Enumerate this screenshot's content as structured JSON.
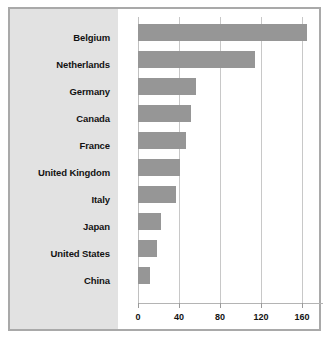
{
  "chart_data": {
    "type": "bar",
    "orientation": "horizontal",
    "title": "",
    "subtitle": "",
    "xlabel": "",
    "ylabel": "",
    "categories": [
      "Belgium",
      "Netherlands",
      "Germany",
      "Canada",
      "France",
      "United Kingdom",
      "Italy",
      "Japan",
      "United States",
      "China"
    ],
    "values": [
      165,
      114,
      57,
      52,
      47,
      41,
      37,
      22,
      19,
      12
    ],
    "series": [
      {
        "name": "",
        "values": [
          165,
          114,
          57,
          52,
          47,
          41,
          37,
          22,
          19,
          12
        ]
      }
    ],
    "xlim": [
      0,
      180
    ],
    "ylim": null,
    "xticks": [
      0,
      40,
      80,
      120,
      160
    ],
    "xtick_labels": [
      "0",
      "40",
      "80",
      "120",
      "160"
    ],
    "grid": true,
    "grid_axis": "x",
    "legend": false,
    "legend_position": "none",
    "annotations": [],
    "colors": {
      "bar_fill": "#969696",
      "label_panel_background": "#e2e2e2",
      "plot_background": "#ffffff",
      "gridline": "#c8c8c8",
      "axis_line": "#b4b4b4",
      "frame_border": "#a9a9a9",
      "text": "#121212"
    }
  }
}
